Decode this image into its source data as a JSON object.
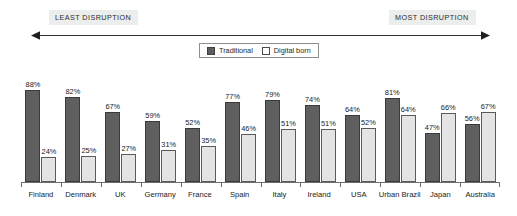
{
  "scale": {
    "least_label": "LEAST DISRUPTION",
    "most_label": "MOST DISRUPTION",
    "arrow_icon": "double-headed-arrow-icon"
  },
  "legend": {
    "entries": [
      {
        "label": "Traditional",
        "swatch": "dark-gray-square",
        "color": "#5f5f5f"
      },
      {
        "label": "Digital born",
        "swatch": "light-outlined-square",
        "color": "#e4e4e4"
      }
    ]
  },
  "chart_data": {
    "type": "bar",
    "title": "",
    "subtitle": "",
    "xlabel": "",
    "ylabel": "",
    "ylim": [
      0,
      100
    ],
    "grid": false,
    "legend_position": "top-center",
    "value_suffix": "%",
    "categories": [
      "Finland",
      "Denmark",
      "UK",
      "Germany",
      "France",
      "Spain",
      "Italy",
      "Ireland",
      "USA",
      "Urban Brazil",
      "Japan",
      "Australia"
    ],
    "series": [
      {
        "name": "Traditional",
        "color": "#5f5f5f",
        "values": [
          88,
          82,
          67,
          59,
          52,
          77,
          79,
          74,
          64,
          81,
          47,
          56
        ],
        "labels": [
          "88%",
          "82%",
          "67%",
          "59%",
          "52%",
          "77%",
          "79%",
          "74%",
          "64%",
          "81%",
          "47%",
          "56%"
        ]
      },
      {
        "name": "Digital born",
        "color": "#e4e4e4",
        "values": [
          24,
          25,
          27,
          31,
          35,
          46,
          51,
          51,
          52,
          64,
          66,
          67
        ],
        "labels": [
          "24%",
          "25%",
          "27%",
          "31%",
          "35%",
          "46%",
          "51%",
          "51%",
          "52%",
          "64%",
          "66%",
          "67%"
        ]
      }
    ],
    "annotations": [
      "LEAST DISRUPTION",
      "MOST DISRUPTION"
    ]
  }
}
